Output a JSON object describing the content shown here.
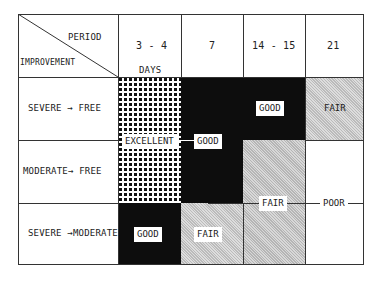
{
  "header": {
    "corner_top": "PERIOD",
    "corner_bottom": "IMPROVEMENT",
    "columns": [
      {
        "label": "3 - 4",
        "sublabel": "DAYS"
      },
      {
        "label": "7"
      },
      {
        "label": "14 - 15"
      },
      {
        "label": "21"
      }
    ]
  },
  "rows": [
    {
      "label": "SEVERE → FREE"
    },
    {
      "label": "MODERATE→ FREE"
    },
    {
      "label": "SEVERE →MODERATE"
    }
  ],
  "ratings": {
    "excellent": "EXCELLENT",
    "good_row1": "GOOD",
    "good_mid": "GOOD",
    "good_row3": "GOOD",
    "fair_row1": "FAIR",
    "fair_mid": "FAIR",
    "fair_row3": "FAIR",
    "poor": "POOR"
  },
  "colors": {
    "excellent": "dotted-dense",
    "good": "#0d0d0d",
    "fair": "#c8c8c8",
    "poor": "#ffffff"
  }
}
